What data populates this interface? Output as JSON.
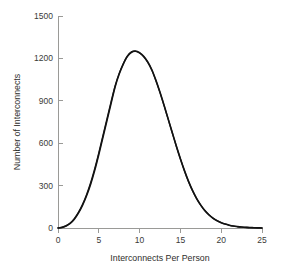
{
  "chart_data": {
    "type": "line",
    "title": "",
    "subtitle": "",
    "xlabel": "Interconnects Per Person",
    "ylabel": "Number of Interconnects",
    "xlim": [
      0,
      25
    ],
    "ylim": [
      0,
      1500
    ],
    "xticks": [
      0,
      5,
      10,
      15,
      20,
      25
    ],
    "yticks": [
      0,
      300,
      600,
      900,
      1200,
      1500
    ],
    "xtick_labels": [
      "0",
      "5",
      "10",
      "15",
      "20",
      "25"
    ],
    "ytick_labels": [
      "0",
      "300",
      "600",
      "900",
      "1200",
      "1500"
    ],
    "grid": false,
    "legend": false,
    "legend_position": "none",
    "annotations": [],
    "x": [
      0,
      0.5,
      1,
      1.5,
      2,
      2.5,
      3,
      3.5,
      4,
      4.5,
      5,
      5.5,
      6,
      6.5,
      7,
      7.5,
      8,
      8.5,
      9,
      9.5,
      10,
      10.5,
      11,
      11.5,
      12,
      12.5,
      13,
      13.5,
      14,
      14.5,
      15,
      15.5,
      16,
      16.5,
      17,
      17.5,
      18,
      18.5,
      19,
      19.5,
      20,
      20.5,
      21,
      21.5,
      22,
      22.5,
      23,
      23.5,
      24,
      24.5,
      25
    ],
    "series": [
      {
        "name": "Observed distribution",
        "color": "#121212",
        "values": [
          0,
          4,
          14,
          32,
          62,
          105,
          160,
          228,
          310,
          408,
          520,
          640,
          760,
          880,
          1000,
          1090,
          1160,
          1215,
          1245,
          1252,
          1240,
          1215,
          1175,
          1120,
          1045,
          960,
          868,
          772,
          676,
          580,
          490,
          406,
          330,
          264,
          208,
          162,
          124,
          94,
          70,
          52,
          38,
          28,
          20,
          14,
          10,
          7,
          5,
          3,
          2,
          1,
          0
        ]
      },
      {
        "name": "Fitted curve",
        "color": "#1c1c1c",
        "values": [
          0,
          5,
          16,
          35,
          66,
          110,
          166,
          236,
          320,
          420,
          532,
          652,
          772,
          892,
          1005,
          1094,
          1162,
          1214,
          1243,
          1250,
          1238,
          1212,
          1172,
          1116,
          1042,
          958,
          866,
          770,
          674,
          578,
          488,
          404,
          328,
          262,
          206,
          160,
          122,
          92,
          68,
          50,
          37,
          27,
          19,
          13,
          9,
          6,
          4,
          3,
          2,
          1,
          0
        ]
      }
    ],
    "peak": {
      "x": 9.5,
      "y": 1250
    }
  },
  "figure": {
    "background_color": "#ffffff",
    "axis_color": "#9a9a97",
    "text_color": "#2e2e2c",
    "curve_color": "#121212"
  }
}
